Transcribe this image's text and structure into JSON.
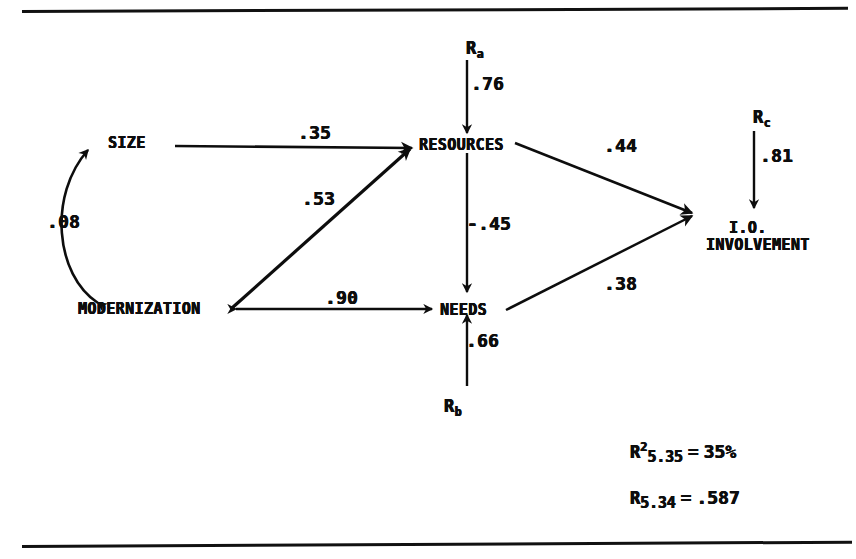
{
  "figure": {
    "type": "path-diagram",
    "title": "",
    "background_color": "#ffffff",
    "ink_color": "#0d0d0d"
  },
  "rules": {
    "top_label": "top-horizontal-rule",
    "bottom_label": "bottom-horizontal-rule"
  },
  "nodes": [
    {
      "id": "size",
      "label": "SIZE",
      "x": 108,
      "y": 134
    },
    {
      "id": "modernization",
      "label": "MODERNIZATION",
      "x": 78,
      "y": 300
    },
    {
      "id": "resources",
      "label": "RESOURCES",
      "x": 419,
      "y": 136
    },
    {
      "id": "needs",
      "label": "NEEDS",
      "x": 440,
      "y": 301
    },
    {
      "id": "involvement_1",
      "label": "I.O.",
      "x": 729,
      "y": 219
    },
    {
      "id": "involvement_2",
      "label": "INVOLVEMENT",
      "x": 706,
      "y": 236
    }
  ],
  "residuals": [
    {
      "id": "ra",
      "symbol": "R",
      "subscript": "a",
      "x": 466,
      "y": 38
    },
    {
      "id": "rb",
      "symbol": "R",
      "subscript": "b",
      "x": 444,
      "y": 396
    },
    {
      "id": "rc",
      "symbol": "R",
      "subscript": "c",
      "x": 753,
      "y": 107
    }
  ],
  "coefficients": [
    {
      "id": "size-to-resources",
      "value": ".35",
      "from": "size",
      "to": "resources",
      "x": 298,
      "y": 122
    },
    {
      "id": "modernization-to-resources",
      "value": ".53",
      "from": "modernization",
      "to": "resources",
      "x": 302,
      "y": 188
    },
    {
      "id": "size-modernization-corr",
      "value": ".08",
      "from": "size",
      "to": "modernization",
      "x": 47,
      "y": 211
    },
    {
      "id": "modernization-needs-corr",
      "value": ".90",
      "from": "modernization",
      "to": "needs",
      "x": 325,
      "y": 287
    },
    {
      "id": "ra-to-resources",
      "value": ".76",
      "from": "ra",
      "to": "resources",
      "x": 471,
      "y": 73
    },
    {
      "id": "resources-to-needs",
      "value": "-.45",
      "from": "resources",
      "to": "needs",
      "x": 467,
      "y": 213
    },
    {
      "id": "rb-to-needs",
      "value": ".66",
      "from": "rb",
      "to": "needs",
      "x": 466,
      "y": 330
    },
    {
      "id": "resources-to-involvement",
      "value": ".44",
      "from": "resources",
      "to": "involvement",
      "x": 604,
      "y": 135
    },
    {
      "id": "needs-to-involvement",
      "value": ".38",
      "from": "needs",
      "to": "involvement",
      "x": 604,
      "y": 273
    },
    {
      "id": "rc-to-involvement",
      "value": ".81",
      "from": "rc",
      "to": "involvement",
      "x": 760,
      "y": 145
    }
  ],
  "statistics": [
    {
      "id": "r-squared",
      "symbol": "R",
      "superscript": "2",
      "subscript": "5.35",
      "equals": "=",
      "value": "35%",
      "x": 630,
      "y": 440
    },
    {
      "id": "multiple-r",
      "symbol": "R",
      "superscript": "",
      "subscript": "5.34",
      "equals": "=",
      "value": ".587",
      "x": 630,
      "y": 487
    }
  ]
}
